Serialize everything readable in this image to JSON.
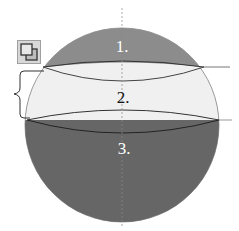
{
  "diagram": {
    "type": "sphere-sections",
    "regions": [
      {
        "id": 1,
        "label": "1.",
        "name": "spherical-cap-top",
        "color": "#8c8c8c",
        "label_color": "#ffffff"
      },
      {
        "id": 2,
        "label": "2.",
        "name": "spherical-zone",
        "color": "#f0f0f0",
        "label_color": "#111111"
      },
      {
        "id": 3,
        "label": "3.",
        "name": "spherical-segment-bottom",
        "color": "#666666",
        "label_color": "#ffffff"
      }
    ],
    "brace": {
      "spans_region": 2
    },
    "axis": {
      "style": "dashed-vertical"
    },
    "toolbar": {
      "icon": "copy-icon"
    }
  }
}
